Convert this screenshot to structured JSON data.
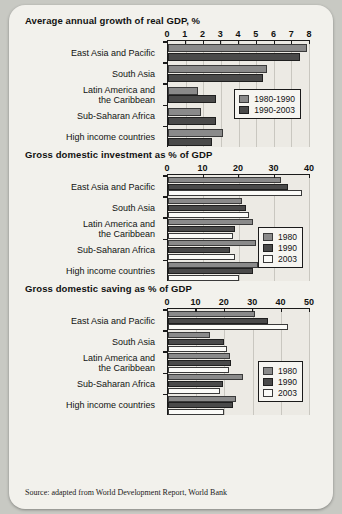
{
  "source_note": "Source: adapted from World Development Report, World Bank",
  "colors": {
    "series_1980_1990": "#8a8a8a",
    "series_1990_2003": "#4a4a4a",
    "series_1980": "#8a8a8a",
    "series_1990": "#4a4a4a",
    "series_2003": "#fbfbf8",
    "page_background": "#f2f1ec",
    "outer_background": "#c8c9c3",
    "axis": "#1a1a1a"
  },
  "chart_data": [
    {
      "type": "bar",
      "orientation": "horizontal",
      "title": "Average annual growth of real GDP, %",
      "xlabel": "",
      "ylabel": "",
      "xlim": [
        0,
        8
      ],
      "ticks": [
        0,
        1,
        2,
        3,
        4,
        5,
        6,
        7,
        8
      ],
      "grid": true,
      "legend_position": "inside-right",
      "categories": [
        "East Asia and Pacific",
        "South Asia",
        "Latin America and\nthe Caribbean",
        "Sub-Saharan Africa",
        "High income countries"
      ],
      "series": [
        {
          "name": "1980-1990",
          "values": [
            7.9,
            5.6,
            1.7,
            1.9,
            3.1
          ]
        },
        {
          "name": "1990-2003",
          "values": [
            7.5,
            5.4,
            2.7,
            2.7,
            2.5
          ]
        }
      ]
    },
    {
      "type": "bar",
      "orientation": "horizontal",
      "title": "Gross domestic investment as % of GDP",
      "xlabel": "",
      "ylabel": "",
      "xlim": [
        0,
        40
      ],
      "ticks": [
        0,
        10,
        20,
        30,
        40
      ],
      "grid": true,
      "legend_position": "inside-right",
      "categories": [
        "East Asia and Pacific",
        "South Asia",
        "Latin America and\nthe Caribbean",
        "Sub-Saharan Africa",
        "High income countries"
      ],
      "series": [
        {
          "name": "1980",
          "values": [
            32,
            21,
            24,
            25,
            25.5
          ]
        },
        {
          "name": "1990",
          "values": [
            34,
            22,
            19,
            17.5,
            24
          ]
        },
        {
          "name": "2003",
          "values": [
            38,
            23,
            18.5,
            19,
            20
          ]
        }
      ]
    },
    {
      "type": "bar",
      "orientation": "horizontal",
      "title": "Gross domestic saving as % of GDP",
      "xlabel": "",
      "ylabel": "",
      "xlim": [
        0,
        50
      ],
      "ticks": [
        0,
        10,
        20,
        30,
        40,
        50
      ],
      "grid": true,
      "legend_position": "inside-right",
      "categories": [
        "East Asia and Pacific",
        "South Asia",
        "Latin America and\nthe Caribbean",
        "Sub-Saharan Africa",
        "High income countries"
      ],
      "series": [
        {
          "name": "1980",
          "values": [
            31,
            15,
            22,
            26.5,
            24
          ]
        },
        {
          "name": "1990",
          "values": [
            35.5,
            20,
            22.5,
            19.5,
            23
          ]
        },
        {
          "name": "2003",
          "values": [
            42.5,
            21,
            21.5,
            18.5,
            20
          ]
        }
      ]
    }
  ]
}
